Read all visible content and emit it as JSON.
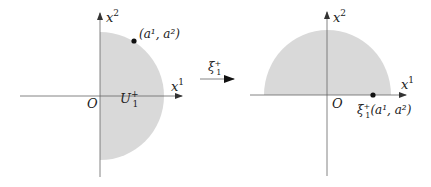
{
  "figure": {
    "colors": {
      "region_fill": "#d9d9d9",
      "axis": "#555555",
      "text": "#222222",
      "point": "#111111"
    },
    "left_panel": {
      "x_axis_label": "x",
      "x_axis_sup": "1",
      "y_axis_label": "x",
      "y_axis_sup": "2",
      "origin_label": "O",
      "region_label": "U",
      "region_sub": "1",
      "region_sup": "+",
      "point_label": "(a¹, a²)"
    },
    "map_arrow": {
      "label": "ξ",
      "label_sub": "1",
      "label_sup": "+"
    },
    "right_panel": {
      "x_axis_label": "x",
      "x_axis_sup": "1",
      "y_axis_label": "x",
      "y_axis_sup": "2",
      "origin_label": "O",
      "point_label_prefix": "ξ",
      "point_label_sub": "1",
      "point_label_sup": "+",
      "point_label_args": "(a¹, a²)"
    }
  }
}
